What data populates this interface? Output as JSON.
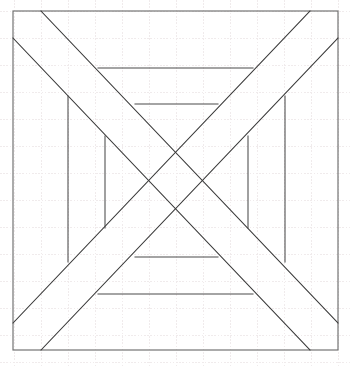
{
  "figure": {
    "canvas": {
      "width": 351,
      "height": 366
    },
    "colors": {
      "background": "#ffffff",
      "grid": "#f0ebec",
      "border": "#6e6e6e",
      "diagonal": "#3a3a3a",
      "ortho": "#4a4a4a"
    },
    "grid": {
      "visible": true,
      "spacing": 27,
      "style": "dotted",
      "origin_x": 14,
      "origin_y": 11
    },
    "outer_border": {
      "x": 13,
      "y": 11,
      "width": 325,
      "height": 339
    },
    "diagonals": [
      {
        "name": "down-right-outer",
        "x1": 41,
        "y1": 11,
        "x2": 338,
        "y2": 323
      },
      {
        "name": "down-right-inner",
        "x1": 13,
        "y1": 38,
        "x2": 310,
        "y2": 350
      },
      {
        "name": "up-right-outer",
        "x1": 13,
        "y1": 323,
        "x2": 310,
        "y2": 11
      },
      {
        "name": "up-right-inner",
        "x1": 41,
        "y1": 350,
        "x2": 338,
        "y2": 38
      }
    ],
    "horizontals": [
      {
        "name": "top-outer",
        "x1": 98,
        "x2": 253,
        "y": 68
      },
      {
        "name": "top-inner",
        "x1": 135,
        "x2": 218,
        "y": 104
      },
      {
        "name": "bottom-inner",
        "x1": 135,
        "x2": 218,
        "y": 257
      },
      {
        "name": "bottom-outer",
        "x1": 98,
        "x2": 253,
        "y": 294
      }
    ],
    "verticals": [
      {
        "name": "left-outer",
        "y1": 96,
        "y2": 262,
        "x": 68
      },
      {
        "name": "left-inner",
        "y1": 136,
        "y2": 228,
        "x": 105
      },
      {
        "name": "right-inner",
        "y1": 136,
        "y2": 228,
        "x": 248
      },
      {
        "name": "right-outer",
        "y1": 96,
        "y2": 262,
        "x": 285
      }
    ]
  }
}
